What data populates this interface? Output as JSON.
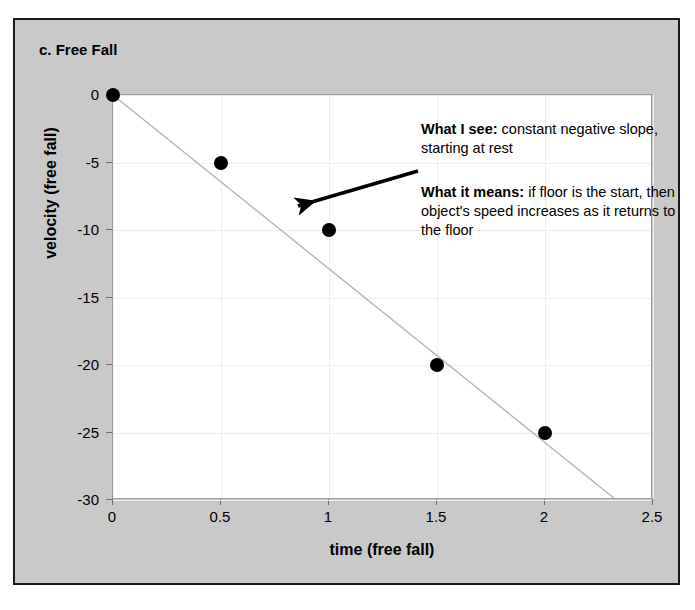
{
  "chart_data": {
    "type": "scatter",
    "title": "c. Free Fall",
    "xlabel": "time (free fall)",
    "ylabel": "velocity (free fall)",
    "xlim": [
      0,
      2.5
    ],
    "ylim": [
      -30,
      0
    ],
    "xticks": [
      "0",
      "0.5",
      "1",
      "1.5",
      "2",
      "2.5"
    ],
    "xtick_values": [
      0,
      0.5,
      1,
      1.5,
      2,
      2.5
    ],
    "yticks": [
      "0",
      "-5",
      "-10",
      "-15",
      "-20",
      "-25",
      "-30"
    ],
    "ytick_values": [
      0,
      -5,
      -10,
      -15,
      -20,
      -25,
      -30
    ],
    "grid": true,
    "legend": "none",
    "x": [
      0,
      0.5,
      1,
      1.5,
      2
    ],
    "values": [
      0,
      -5,
      -10,
      -20,
      -25
    ],
    "points": [
      {
        "x": 0,
        "y": 0
      },
      {
        "x": 0.5,
        "y": -5
      },
      {
        "x": 1,
        "y": -10
      },
      {
        "x": 1.5,
        "y": -20
      },
      {
        "x": 2,
        "y": -25
      }
    ],
    "trendline": {
      "from": {
        "x": 0,
        "y": 0
      },
      "to": {
        "x": 2.33,
        "y": -30
      },
      "style": "solid-thin-gray"
    },
    "annotations": [
      {
        "id": "what-i-see",
        "label": "What I see:",
        "text": " constant negative slope, starting at rest"
      },
      {
        "id": "what-it-means",
        "label": "What it means:",
        "text": " if floor is the start, then object's speed increases as it returns to the floor"
      }
    ],
    "arrow": {
      "name": "pointer-arrow",
      "direction": "down-left"
    }
  },
  "colors": {
    "figure_background": "#c9c9c9",
    "plot_background": "#ffffff",
    "marker": "#000000",
    "gridline": "#ededed",
    "trendline": "#b4b4b4",
    "frame_border": "#1a1a1a"
  }
}
